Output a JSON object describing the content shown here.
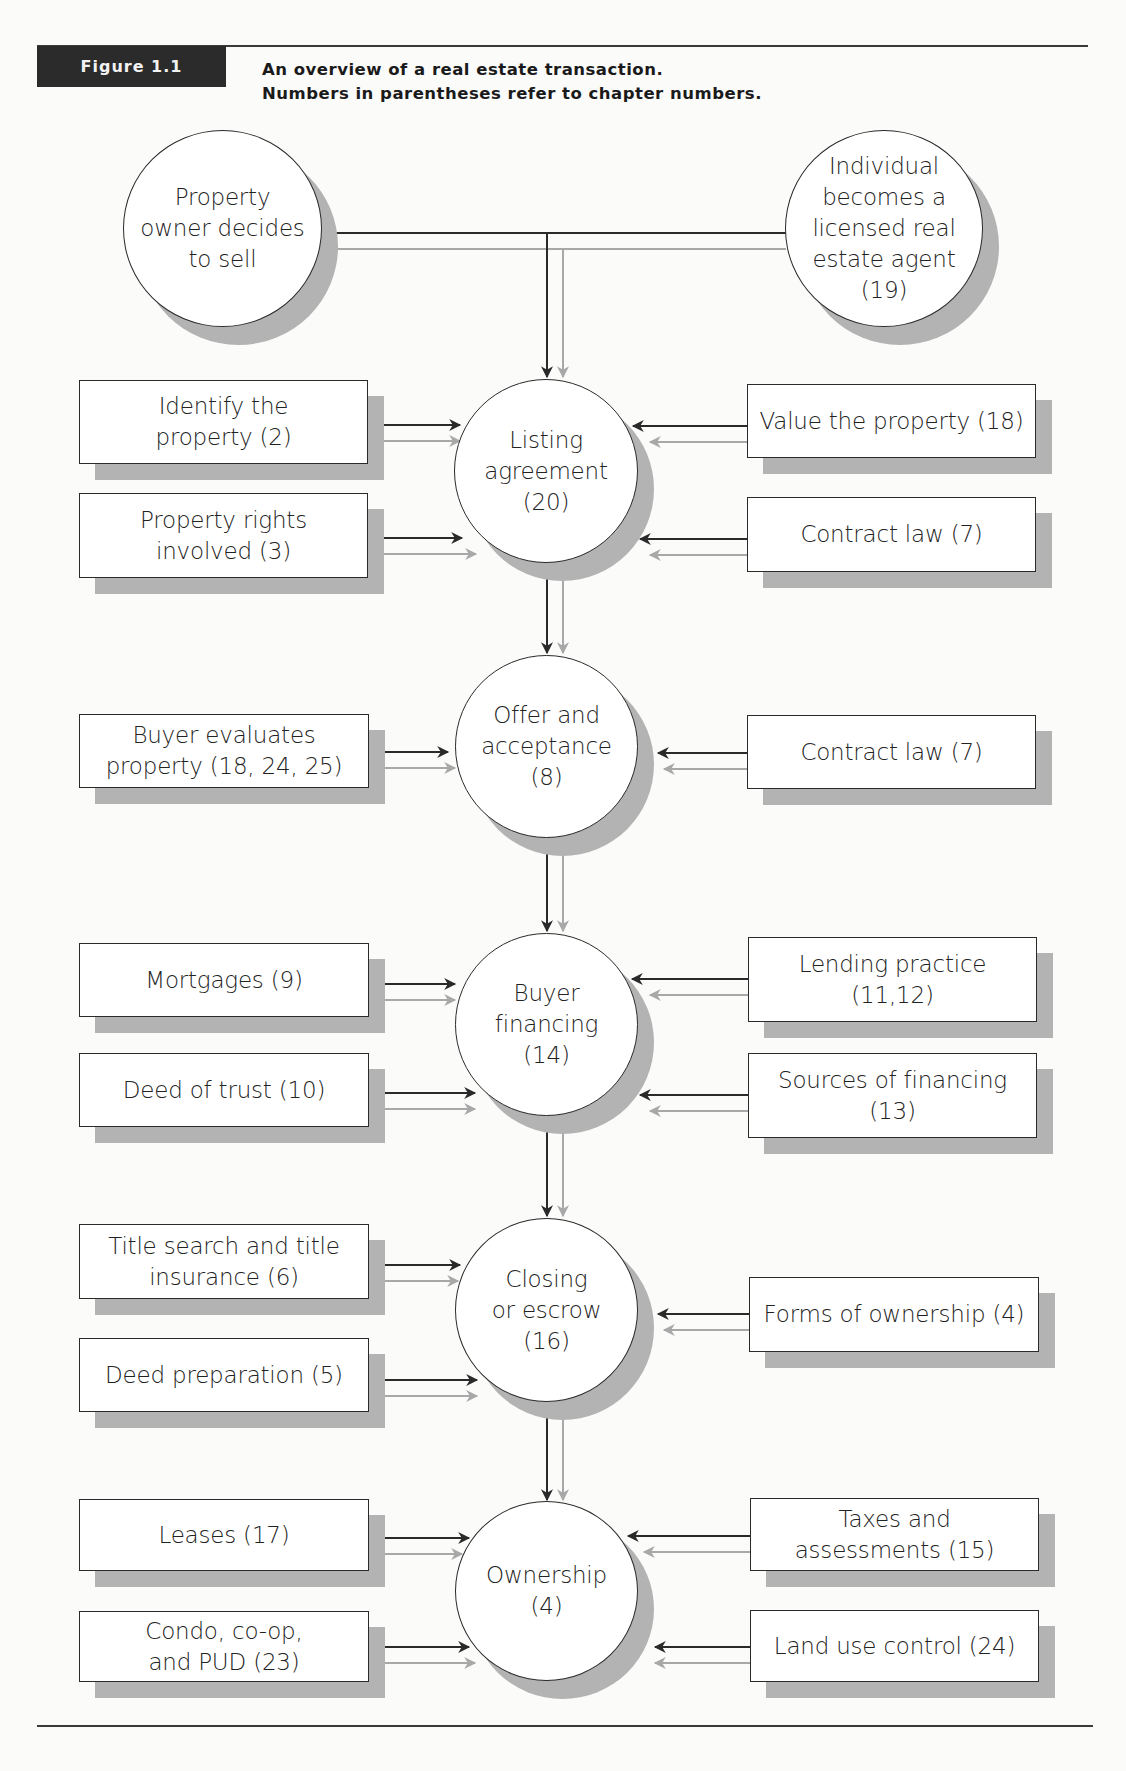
{
  "header": {
    "figure_label": "Figure 1.1",
    "title_line1": "An overview of a real estate transaction.",
    "title_line2": "Numbers in parentheses refer to chapter numbers."
  },
  "colors": {
    "primary_arrow": "#2a2a2a",
    "secondary_arrow": "#a8a8a8",
    "shadow": "#b3b3b3",
    "label_bg": "#2b2b2b"
  },
  "nodes": {
    "seller": {
      "lines": [
        "Property",
        "owner decides",
        "to sell"
      ]
    },
    "agent": {
      "lines": [
        "Individual",
        "becomes a",
        "licensed real",
        "estate agent",
        "(19)"
      ]
    },
    "listing": {
      "lines": [
        "Listing",
        "agreement",
        "(20)"
      ]
    },
    "offer": {
      "lines": [
        "Offer and",
        "acceptance",
        "(8)"
      ]
    },
    "financing": {
      "lines": [
        "Buyer",
        "financing",
        "(14)"
      ]
    },
    "closing": {
      "lines": [
        "Closing",
        "or escrow",
        "(16)"
      ]
    },
    "ownership": {
      "lines": [
        "Ownership",
        "(4)"
      ]
    }
  },
  "inputs": {
    "identify_property": {
      "lines": [
        "Identify the",
        "property (2)"
      ]
    },
    "property_rights": {
      "lines": [
        "Property rights",
        "involved (3)"
      ]
    },
    "value_property": {
      "lines": [
        "Value the property (18)"
      ]
    },
    "contract_law_1": {
      "lines": [
        "Contract law (7)"
      ]
    },
    "buyer_evaluates": {
      "lines": [
        "Buyer evaluates",
        "property (18, 24, 25)"
      ]
    },
    "contract_law_2": {
      "lines": [
        "Contract law (7)"
      ]
    },
    "mortgages": {
      "lines": [
        "Mortgages (9)"
      ]
    },
    "deed_of_trust": {
      "lines": [
        "Deed of trust (10)"
      ]
    },
    "lending_practice": {
      "lines": [
        "Lending practice",
        "(11,12)"
      ]
    },
    "sources_financing": {
      "lines": [
        "Sources of financing",
        "(13)"
      ]
    },
    "title_search": {
      "lines": [
        "Title search and title",
        "insurance (6)"
      ]
    },
    "deed_preparation": {
      "lines": [
        "Deed preparation (5)"
      ]
    },
    "forms_ownership": {
      "lines": [
        "Forms of ownership (4)"
      ]
    },
    "leases": {
      "lines": [
        "Leases (17)"
      ]
    },
    "condo": {
      "lines": [
        "Condo, co-op,",
        "and PUD (23)"
      ]
    },
    "taxes": {
      "lines": [
        "Taxes and",
        "assessments (15)"
      ]
    },
    "land_use": {
      "lines": [
        "Land use control (24)"
      ]
    }
  }
}
